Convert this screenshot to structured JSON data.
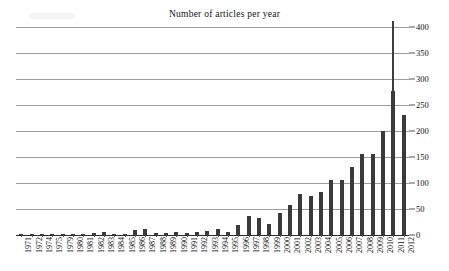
{
  "chart_data": {
    "type": "bar",
    "title": "Number of articles per year",
    "xlabel": "",
    "ylabel": "",
    "ylim": [
      0,
      400
    ],
    "ytick_step": 50,
    "yticks": [
      0,
      50,
      100,
      150,
      200,
      250,
      300,
      350,
      400
    ],
    "ytick_labels": [
      "0",
      "50",
      "100",
      "150",
      "200",
      "250",
      "300",
      "350",
      "400"
    ],
    "y_axis_position": "right",
    "grid": true,
    "grid_axis": "y",
    "legend": null,
    "bar_color": "#3a3a3a",
    "categories": [
      "1971",
      "1972",
      "1974",
      "1975",
      "1979",
      "1980",
      "1981",
      "1982",
      "1983",
      "1984",
      "1985",
      "1986",
      "1987",
      "1988",
      "1989",
      "1990",
      "1991",
      "1992",
      "1993",
      "1994",
      "1995",
      "1996",
      "1997",
      "1998",
      "1999",
      "2000",
      "2001",
      "2002",
      "2003",
      "2004",
      "2005",
      "2006",
      "2007",
      "2008",
      "2009",
      "2010",
      "2011",
      "2012"
    ],
    "values": [
      1,
      1,
      1,
      1,
      2,
      2,
      2,
      3,
      6,
      2,
      2,
      10,
      12,
      3,
      4,
      6,
      4,
      6,
      7,
      12,
      6,
      20,
      36,
      33,
      22,
      42,
      57,
      78,
      75,
      83,
      105,
      105,
      130,
      155,
      155,
      200,
      277,
      230
    ],
    "note_omitted_years": [
      "1973",
      "1976",
      "1977",
      "1978"
    ]
  }
}
